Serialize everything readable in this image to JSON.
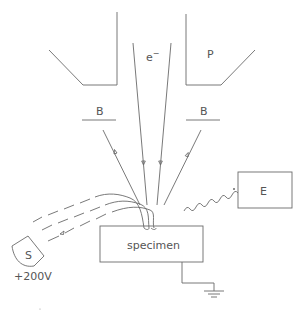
{
  "diagram": {
    "type": "SEM secondary electron detection schematic",
    "labels": {
      "electron": "e",
      "electron_sup": "−",
      "pole_piece": "P",
      "baffle_left": "B",
      "baffle_right": "B",
      "specimen": "specimen",
      "detector_e": "E",
      "detector_s": "S",
      "bias_voltage": "+200V"
    },
    "colors": {
      "line": "#6a6a6a",
      "text": "#555555",
      "background": "#ffffff"
    }
  }
}
